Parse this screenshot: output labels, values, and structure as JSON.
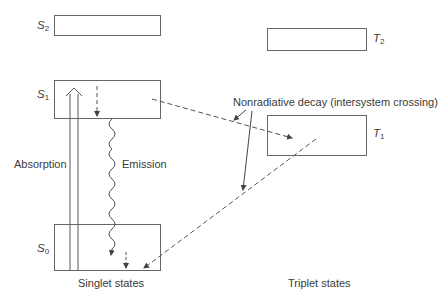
{
  "diagram": {
    "states": {
      "S2": {
        "symbol": "S",
        "sub": "2",
        "group": "singlet"
      },
      "S1": {
        "symbol": "S",
        "sub": "1",
        "group": "singlet"
      },
      "S0": {
        "symbol": "S",
        "sub": "0",
        "group": "singlet"
      },
      "T2": {
        "symbol": "T",
        "sub": "2",
        "group": "triplet"
      },
      "T1": {
        "symbol": "T",
        "sub": "1",
        "group": "triplet"
      }
    },
    "labels": {
      "absorption": "Absorption",
      "emission": "Emission",
      "nonradiative": "Nonradiative decay (intersystem crossing)",
      "singlet_states": "Singlet states",
      "triplet_states": "Triplet states"
    },
    "transitions": [
      {
        "from": "S0",
        "to": "S1",
        "type": "absorption",
        "style": "double-arrow"
      },
      {
        "from": "S1",
        "to": "S1-bottom",
        "type": "vibrational-relaxation",
        "style": "dashed"
      },
      {
        "from": "S1",
        "to": "S0",
        "type": "emission",
        "style": "wavy"
      },
      {
        "from": "S0",
        "to": "S0-bottom",
        "type": "vibrational-relaxation",
        "style": "dashed"
      },
      {
        "from": "S1",
        "to": "T1",
        "type": "intersystem-crossing",
        "style": "dashed"
      },
      {
        "from": "T1",
        "to": "S0",
        "type": "intersystem-crossing",
        "style": "dashed"
      }
    ],
    "colors": {
      "line": "#555555",
      "text": "#3a3a3a",
      "background": "#ffffff"
    }
  }
}
